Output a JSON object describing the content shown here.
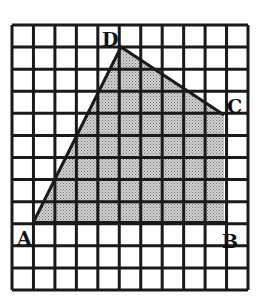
{
  "figure": {
    "type": "grid-polygon",
    "grid": {
      "columns": 11,
      "rows": 12,
      "line_color": "#1a1a1a",
      "background": "#ffffff"
    },
    "polygon": {
      "name": "ABCD",
      "fill": "shaded (stippled gray)",
      "vertices": [
        {
          "label": "A",
          "grid_x": 1,
          "grid_y": 9
        },
        {
          "label": "D",
          "grid_x": 5,
          "grid_y": 1
        },
        {
          "label": "C",
          "grid_x": 10,
          "grid_y": 4
        },
        {
          "label": "B",
          "grid_x": 10,
          "grid_y": 9
        }
      ]
    },
    "labels": {
      "A": "A",
      "B": "B",
      "C": "C",
      "D": "D"
    }
  }
}
